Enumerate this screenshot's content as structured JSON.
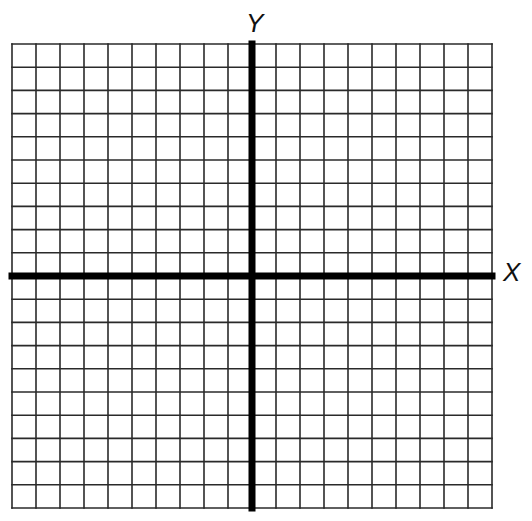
{
  "diagram": {
    "type": "coordinate-grid",
    "columns": 20,
    "rows": 20,
    "grid": {
      "left": 12,
      "top": 44,
      "right": 492,
      "bottom": 508
    },
    "y_axis_column": 10,
    "x_axis_row": 10,
    "line_color": "#2a2a2a",
    "axis_color": "#000000",
    "x_label": "X",
    "y_label": "Y"
  }
}
